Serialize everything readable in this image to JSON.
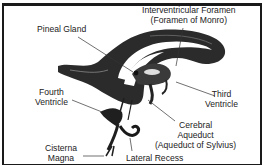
{
  "diagram": {
    "labels": {
      "pineal_gland": "Pineal Gland",
      "interventricular_foramen": {
        "line1": "Interventricular Foramen",
        "line2": "(Foramen of Monro)"
      },
      "third_ventricle": {
        "line1": "Third",
        "line2": "Ventricle"
      },
      "fourth_ventricle": {
        "line1": "Fourth",
        "line2": "Ventricle"
      },
      "cerebral_aqueduct": {
        "line1": "Cerebral",
        "line2": "Aqueduct",
        "line3": "(Aqueduct  of Sylvius)"
      },
      "cisterna_magna": {
        "line1": "Cisterna",
        "line2": "Magna"
      },
      "lateral_recess": "Lateral Recess"
    },
    "colors": {
      "ink": "#1a1a1a",
      "background": "#ffffff"
    }
  }
}
